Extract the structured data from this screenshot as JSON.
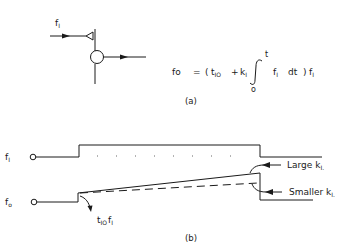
{
  "panel_a": {
    "caption": "(a)",
    "input_label": "f",
    "input_label_sub": "I",
    "output_label": "fo",
    "equation": {
      "lhs": "fo",
      "equals": "=",
      "open": "(",
      "t_io": "t",
      "t_io_sub": "IO",
      "plus": "+",
      "k": "k",
      "k_sub": "I",
      "integral": "∫",
      "upper_limit": "t",
      "lower_limit": "o",
      "integrand": "f",
      "integrand_sub": "I",
      "dt": "dt",
      "close": ")",
      "factor": "f",
      "factor_sub": "I"
    }
  },
  "panel_b": {
    "caption": "(b)",
    "fi_label": "f",
    "fi_label_sub": "I",
    "fo_label": "f",
    "fo_label_sub": "o",
    "step_annotation": "t",
    "step_annotation_sub": "IO",
    "step_annotation_f": "f",
    "step_annotation_f_sub": "I",
    "large_label": "Large  k",
    "large_label_sub": "I.",
    "smaller_label": "Smaller  k",
    "smaller_label_sub": "I."
  }
}
